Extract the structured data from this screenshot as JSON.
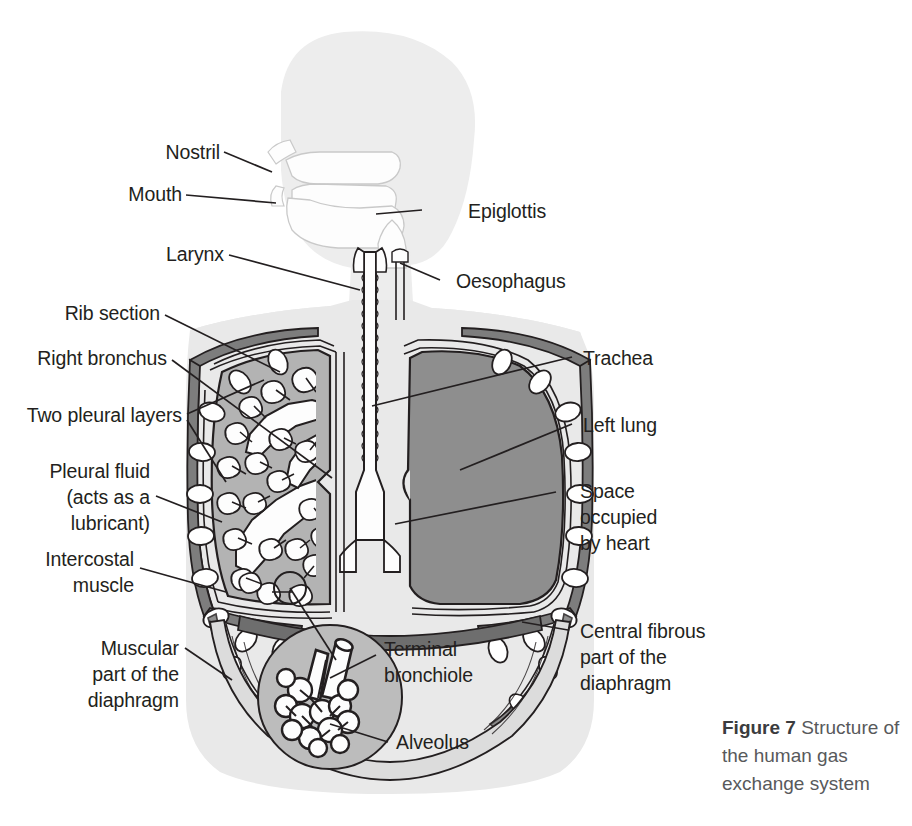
{
  "figure": {
    "caption_label": "Figure 7",
    "caption_text": " Structure of the human gas exchange system",
    "title": "Structure of the human gas exchange system"
  },
  "colors": {
    "body_fill": "#e9e9e9",
    "head_fill": "#ededed",
    "airway_fill": "#fdfdfd",
    "right_lung_fill": "#b3b3b3",
    "left_lung_fill": "#8e8e8e",
    "rib_muscle_fill": "#7d7d7d",
    "rib_bone_fill": "#ffffff",
    "diaphragm_fibrous_fill": "#6e6e6e",
    "inset_fill": "#bcbcbc",
    "stroke": "#231f20",
    "caption_text": "#58595b"
  },
  "labels": {
    "left": [
      {
        "id": "nostril",
        "text": "Nostril"
      },
      {
        "id": "mouth",
        "text": "Mouth"
      },
      {
        "id": "larynx",
        "text": "Larynx"
      },
      {
        "id": "rib-section",
        "text": "Rib section"
      },
      {
        "id": "right-bronchus",
        "text": "Right bronchus"
      },
      {
        "id": "two-pleural-layers",
        "text": "Two pleural layers"
      },
      {
        "id": "pleural-fluid",
        "text": "Pleural fluid\n(acts as a\nlubricant)"
      },
      {
        "id": "intercostal-muscle",
        "text": "Intercostal\nmuscle"
      },
      {
        "id": "muscular-diaphragm",
        "text": "Muscular\npart of the\ndiaphragm"
      }
    ],
    "right": [
      {
        "id": "epiglottis",
        "text": "Epiglottis"
      },
      {
        "id": "oesophagus",
        "text": "Oesophagus"
      },
      {
        "id": "trachea",
        "text": "Trachea"
      },
      {
        "id": "left-lung",
        "text": "Left lung"
      },
      {
        "id": "space-occupied-by-heart",
        "text": "Space\noccupied\nby heart"
      },
      {
        "id": "central-fibrous-diaphragm",
        "text": "Central fibrous\npart of the\ndiaphragm"
      }
    ],
    "inset": [
      {
        "id": "terminal-bronchiole",
        "text": "Terminal\nbronchiole"
      },
      {
        "id": "alveolus",
        "text": "Alveolus"
      }
    ]
  }
}
